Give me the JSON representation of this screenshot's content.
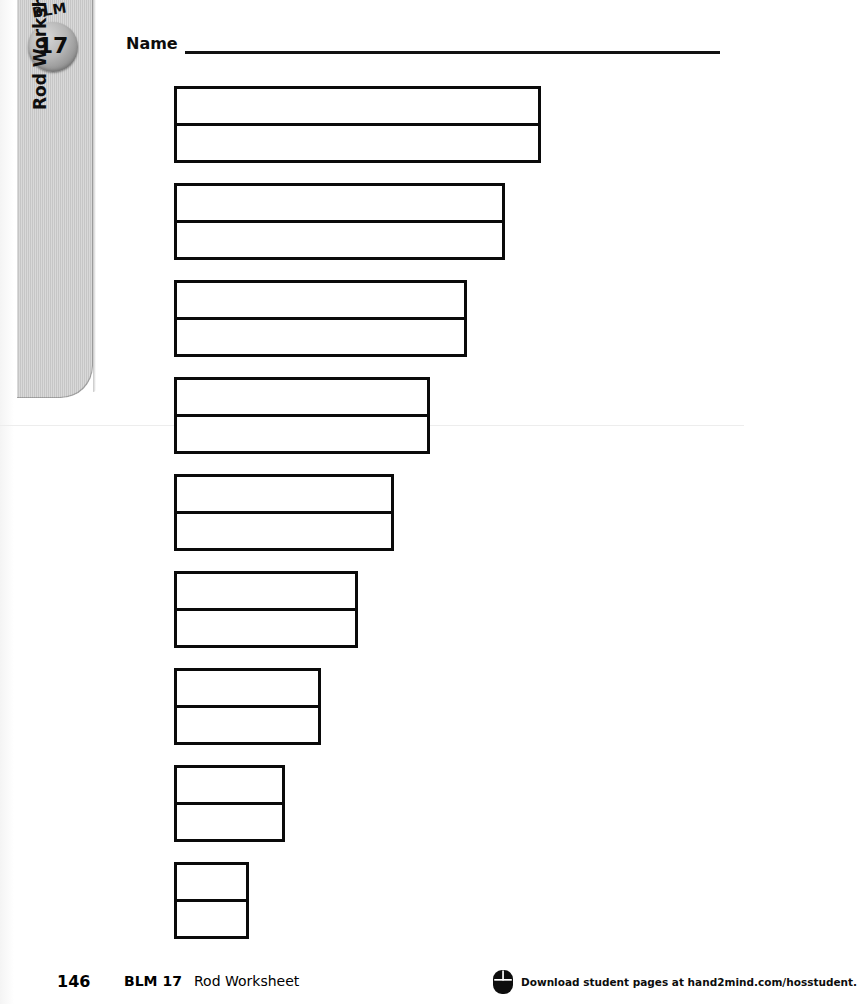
{
  "page": {
    "width": 744,
    "height": 1004,
    "background_color": "#ffffff",
    "ink_color": "#0a0a0a"
  },
  "side_tab": {
    "background_color": "#c9c9c9",
    "badge": {
      "label": "BLM",
      "number": "17",
      "icon": "blm-badge-circle"
    },
    "vertical_title": "Rod Worksheet"
  },
  "name_field": {
    "label": "Name",
    "value": "",
    "placeholder": ""
  },
  "worksheet": {
    "title": "Rod Worksheet",
    "rod_count": 9,
    "rod_rows_each": 2,
    "rods": [
      {
        "index": 1,
        "label": "rod-1",
        "width_px": 367,
        "rows": 2
      },
      {
        "index": 2,
        "label": "rod-2",
        "width_px": 331,
        "rows": 2
      },
      {
        "index": 3,
        "label": "rod-3",
        "width_px": 293,
        "rows": 2
      },
      {
        "index": 4,
        "label": "rod-4",
        "width_px": 256,
        "rows": 2
      },
      {
        "index": 5,
        "label": "rod-5",
        "width_px": 220,
        "rows": 2
      },
      {
        "index": 6,
        "label": "rod-6",
        "width_px": 184,
        "rows": 2
      },
      {
        "index": 7,
        "label": "rod-7",
        "width_px": 147,
        "rows": 2
      },
      {
        "index": 8,
        "label": "rod-8",
        "width_px": 111,
        "rows": 2
      },
      {
        "index": 9,
        "label": "rod-9",
        "width_px": 75,
        "rows": 2
      }
    ]
  },
  "footer": {
    "page_number": "146",
    "code": "BLM 17",
    "title": "Rod Worksheet",
    "icon": "computer-mouse-icon",
    "link_text": "Download student pages at hand2mind.com/hosstudent."
  }
}
